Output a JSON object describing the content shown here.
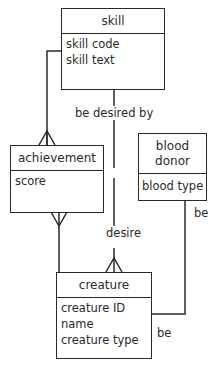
{
  "entities": {
    "skill": {
      "name": "skill",
      "attributes": [
        "skill code",
        "skill text"
      ]
    },
    "achievement": {
      "name": "achievement",
      "attributes": [
        "score"
      ]
    },
    "blood_donor": {
      "name": "blood donor",
      "attributes": [
        "blood type"
      ]
    },
    "creature": {
      "name": "creature",
      "attributes": [
        "creature ID",
        "name",
        "creature type"
      ]
    }
  },
  "relationships": {
    "be_desired_by": "be desired by",
    "desire": "desire",
    "be_top": "be",
    "be_bottom": "be"
  }
}
